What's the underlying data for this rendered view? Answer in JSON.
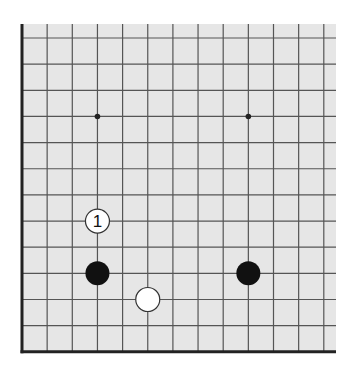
{
  "board": {
    "description": "Go board diagram excerpt (lower-left corner)",
    "background": "#e6e6e6",
    "line_color": "#555555",
    "edge_color": "#222222",
    "columns": 13,
    "rows": 13,
    "edges": [
      "left",
      "bottom"
    ],
    "star_points": [
      {
        "col": 3,
        "row": 3
      },
      {
        "col": 9,
        "row": 3
      }
    ],
    "stones": [
      {
        "col": 3,
        "row": 7,
        "color": "white",
        "label": "1"
      },
      {
        "col": 3,
        "row": 9,
        "color": "black",
        "label": ""
      },
      {
        "col": 5,
        "row": 10,
        "color": "white",
        "label": ""
      },
      {
        "col": 9,
        "row": 9,
        "color": "black",
        "label": ""
      }
    ]
  }
}
